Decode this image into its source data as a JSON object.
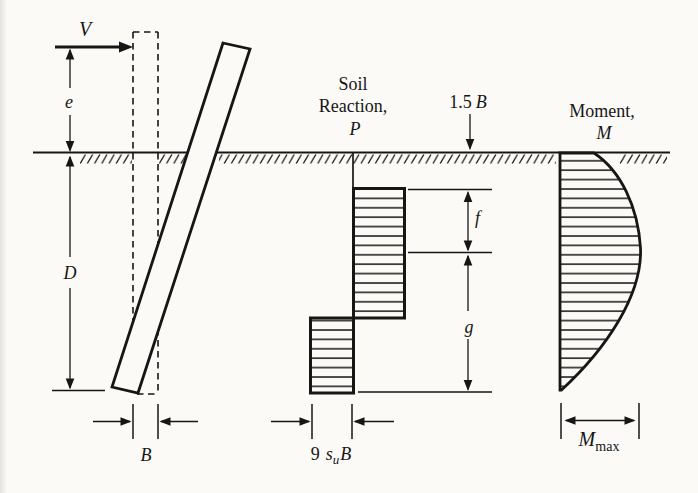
{
  "colors": {
    "ink": "#161616",
    "paper": "#fbfaf7"
  },
  "pile": {
    "force_label": "V",
    "eccentricity_label": "e",
    "embedment_label": "D",
    "width_label": "B"
  },
  "soil_reaction": {
    "title_line1": "Soil",
    "title_line2": "Reaction,",
    "symbol": "P",
    "offset_value": "1.5",
    "offset_symbol": "B",
    "f_label": "f",
    "g_label": "g",
    "pressure_coefficient": "9",
    "pressure_s": "s",
    "pressure_s_sub": "u",
    "pressure_B": "B"
  },
  "moment": {
    "title": "Moment,",
    "symbol": "M",
    "max_base": "M",
    "max_sub": "max"
  }
}
